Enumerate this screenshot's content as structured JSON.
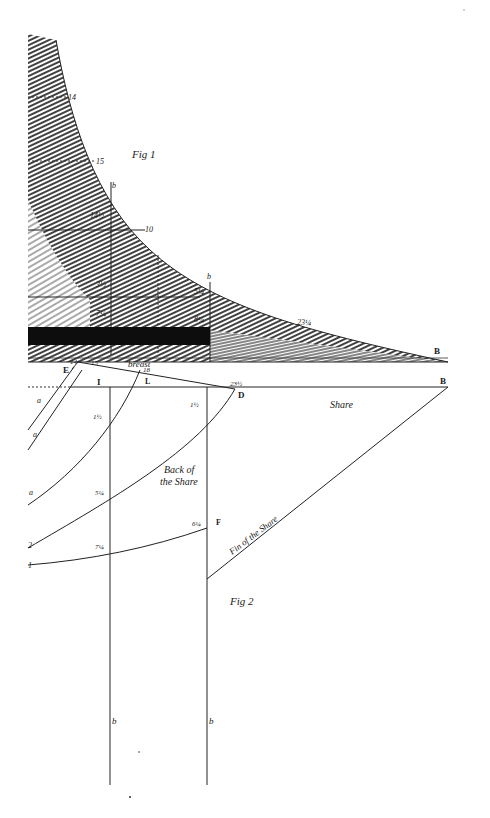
{
  "figure1": {
    "title": "Fig 1",
    "curve_labels": [
      "14",
      "15",
      "b",
      "14½",
      "10",
      "b",
      "23¼",
      "B"
    ],
    "inner_labels": [
      "3½",
      "7¼",
      "8¼",
      "5¼"
    ],
    "section_label": "breast"
  },
  "figure2": {
    "title": "Fig 2",
    "point_labels": {
      "E": "E",
      "I": "I",
      "L": "L",
      "D": "D",
      "B": "B",
      "F": "F"
    },
    "top_numbers": [
      "14",
      "15",
      "18",
      "23½"
    ],
    "side_labels": [
      "a",
      "a",
      "a",
      "2",
      "1"
    ],
    "measurements": [
      "1½",
      "1½",
      "5¼",
      "7¼",
      "6¼"
    ],
    "bottom_labels": [
      "b",
      "b"
    ],
    "texts": {
      "share": "Share",
      "back_of_share": "Back of the Share",
      "back_line1": "Back of",
      "back_line2": "the Share",
      "fin_of_share": "Fin of the Share",
      "breast": "breast"
    }
  },
  "colors": {
    "ink": "#1a1a1a",
    "paper": "#ffffff",
    "dark_band": "#0d0d0d"
  }
}
